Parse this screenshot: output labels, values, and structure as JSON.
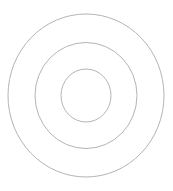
{
  "diagram": {
    "type": "concentric-circles",
    "background": "#ffffff",
    "stroke_color": "#b4b4b4",
    "stroke_width": 1,
    "center": {
      "x": 86,
      "y": 95.5
    },
    "rings": [
      {
        "name": "outer",
        "rx": 78,
        "ry": 81.5
      },
      {
        "name": "middle",
        "rx": 51,
        "ry": 53
      },
      {
        "name": "inner",
        "rx": 25,
        "ry": 26.5
      }
    ]
  }
}
